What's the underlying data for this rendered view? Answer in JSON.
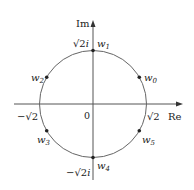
{
  "diagram": {
    "axes": {
      "real_label": "Re",
      "imag_label": "Im",
      "origin_label": "0"
    },
    "intercepts": {
      "pos_real": "√2",
      "neg_real": "−√2",
      "pos_imag": "√2 i",
      "neg_imag": "−√2 i"
    },
    "points": [
      {
        "name": "w0",
        "base": "w",
        "sub": "0"
      },
      {
        "name": "w1",
        "base": "w",
        "sub": "1"
      },
      {
        "name": "w2",
        "base": "w",
        "sub": "2"
      },
      {
        "name": "w3",
        "base": "w",
        "sub": "3"
      },
      {
        "name": "w4",
        "base": "w",
        "sub": "4"
      },
      {
        "name": "w5",
        "base": "w",
        "sub": "5"
      }
    ],
    "colors": {
      "axis": "#555555",
      "circle": "#666666",
      "point": "#222222",
      "text": "#222222"
    }
  }
}
